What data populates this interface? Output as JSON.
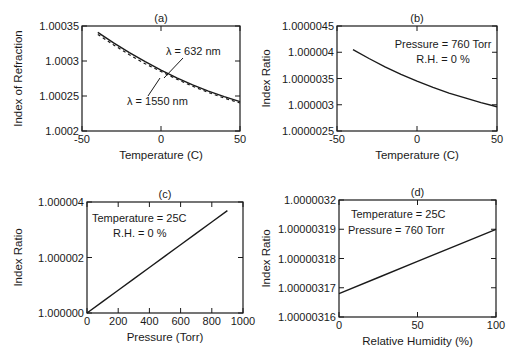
{
  "figure": {
    "panels": [
      {
        "id": "a",
        "label": "(a)",
        "frame": {
          "left": 82,
          "top": 26,
          "right": 240,
          "bottom": 131
        },
        "xlabel": "Temperature (C)",
        "ylabel": "Index of Refraction",
        "xlim": [
          -50,
          50
        ],
        "ylim": [
          1.0002,
          1.00035
        ],
        "xticks": [
          {
            "v": -50,
            "t": "-50"
          },
          {
            "v": 0,
            "t": "0"
          },
          {
            "v": 50,
            "t": "50"
          }
        ],
        "yticks": [
          {
            "v": 1.0002,
            "t": "1.0002"
          },
          {
            "v": 1.00025,
            "t": "1.00025"
          },
          {
            "v": 1.0003,
            "t": "1.0003"
          },
          {
            "v": 1.00035,
            "t": "1.00035"
          }
        ],
        "annotations": [
          {
            "text": "λ  = 632 nm",
            "x": 166,
            "y": 55
          },
          {
            "text": "λ  = 1550 nm",
            "x": 127,
            "y": 105
          }
        ],
        "leaders": [
          {
            "x1": 183,
            "y1": 58,
            "x2": 164,
            "y2": 78
          },
          {
            "x1": 160,
            "y1": 78,
            "x2": 148,
            "y2": 96
          }
        ]
      },
      {
        "id": "b",
        "label": "(b)",
        "frame": {
          "left": 337,
          "top": 26,
          "right": 497,
          "bottom": 131
        },
        "xlabel": "Temperature (C)",
        "ylabel": "Index Ratio",
        "xlim": [
          -50,
          50
        ],
        "ylim": [
          1.0000025,
          1.0000045
        ],
        "xticks": [
          {
            "v": -50,
            "t": "-50"
          },
          {
            "v": 0,
            "t": "0"
          },
          {
            "v": 50,
            "t": "50"
          }
        ],
        "yticks": [
          {
            "v": 1.0000025,
            "t": "1.0000025"
          },
          {
            "v": 1.000003,
            "t": "1.000003"
          },
          {
            "v": 1.0000035,
            "t": "1.0000035"
          },
          {
            "v": 1.000004,
            "t": "1.000004"
          },
          {
            "v": 1.0000045,
            "t": "1.0000045"
          }
        ],
        "annotations": [
          {
            "text": "Pressure = 760 Torr",
            "x": 443,
            "y": 48,
            "anchor": "middle"
          },
          {
            "text": "R.H. = 0 %",
            "x": 443,
            "y": 63,
            "anchor": "middle"
          }
        ],
        "leaders": []
      },
      {
        "id": "c",
        "label": "(c)",
        "frame": {
          "left": 87,
          "top": 202,
          "right": 243,
          "bottom": 313
        },
        "xlabel": "Pressure (Torr)",
        "ylabel": "Index Ratio",
        "xlim": [
          0,
          1000
        ],
        "ylim": [
          1.0,
          1.000004
        ],
        "xticks": [
          {
            "v": 0,
            "t": "0"
          },
          {
            "v": 200,
            "t": "200"
          },
          {
            "v": 400,
            "t": "400"
          },
          {
            "v": 600,
            "t": "600"
          },
          {
            "v": 800,
            "t": "800"
          },
          {
            "v": 1000,
            "t": "1000"
          }
        ],
        "yticks": [
          {
            "v": 1.0,
            "t": "1.000000"
          },
          {
            "v": 1.000002,
            "t": "1.000002"
          },
          {
            "v": 1.000004,
            "t": "1.000004"
          }
        ],
        "annotations": [
          {
            "text": "Temperature = 25C",
            "x": 92,
            "y": 222,
            "anchor": "start"
          },
          {
            "text": "R.H. = 0 %",
            "x": 113,
            "y": 237,
            "anchor": "start"
          }
        ],
        "leaders": []
      },
      {
        "id": "d",
        "label": "(d)",
        "frame": {
          "left": 339,
          "top": 200,
          "right": 496,
          "bottom": 317
        },
        "xlabel": "Relative Humidity (%)",
        "ylabel": "Index Ratio",
        "xlim": [
          0,
          100
        ],
        "ylim": [
          1.00000316,
          1.0000032
        ],
        "xticks": [
          {
            "v": 0,
            "t": "0"
          },
          {
            "v": 50,
            "t": "50"
          },
          {
            "v": 100,
            "t": "100"
          }
        ],
        "yticks": [
          {
            "v": 1.00000316,
            "t": "1.00000316"
          },
          {
            "v": 1.00000317,
            "t": "1.00000317"
          },
          {
            "v": 1.00000318,
            "t": "1.00000318"
          },
          {
            "v": 1.00000319,
            "t": "1.00000319"
          },
          {
            "v": 1.0000032,
            "t": "1.0000032"
          }
        ],
        "annotations": [
          {
            "text": "Temperature = 25C",
            "x": 351,
            "y": 218,
            "anchor": "start"
          },
          {
            "text": "Pressure = 760 Torr",
            "x": 348,
            "y": 234,
            "anchor": "start"
          }
        ],
        "leaders": []
      }
    ]
  },
  "chart_data": [
    {
      "type": "line",
      "title": "(a)",
      "xlabel": "Temperature (C)",
      "ylabel": "Index of Refraction",
      "xlim": [
        -50,
        50
      ],
      "ylim": [
        1.0002,
        1.00035
      ],
      "grid": false,
      "x": [
        -40,
        -30,
        -20,
        -10,
        0,
        10,
        20,
        30,
        40,
        50
      ],
      "series": [
        {
          "name": "λ = 632 nm",
          "style": "solid",
          "values": [
            1.000341,
            1.000326,
            1.000312,
            1.000299,
            1.000287,
            1.000276,
            1.000266,
            1.000257,
            1.000249,
            1.000242
          ]
        },
        {
          "name": "λ = 1550 nm",
          "style": "dashed",
          "values": [
            1.000338,
            1.000323,
            1.000309,
            1.000296,
            1.000285,
            1.000274,
            1.000264,
            1.000255,
            1.000247,
            1.00024
          ]
        }
      ],
      "annotations": [
        "λ = 632 nm",
        "λ = 1550 nm"
      ]
    },
    {
      "type": "line",
      "title": "(b)",
      "xlabel": "Temperature (C)",
      "ylabel": "Index Ratio",
      "xlim": [
        -50,
        50
      ],
      "ylim": [
        1.0000025,
        1.0000045
      ],
      "grid": false,
      "x": [
        -40,
        -30,
        -20,
        -10,
        0,
        10,
        20,
        30,
        40,
        50
      ],
      "series": [
        {
          "name": "Index Ratio",
          "style": "solid",
          "values": [
            1.00000405,
            1.00000388,
            1.00000372,
            1.00000358,
            1.00000345,
            1.00000333,
            1.00000322,
            1.00000313,
            1.00000304,
            1.00000296
          ]
        }
      ],
      "annotations": [
        "Pressure = 760 Torr",
        "R.H. = 0 %"
      ]
    },
    {
      "type": "line",
      "title": "(c)",
      "xlabel": "Pressure (Torr)",
      "ylabel": "Index Ratio",
      "xlim": [
        0,
        1000
      ],
      "ylim": [
        1.0,
        1.000004
      ],
      "grid": false,
      "x": [
        0,
        100,
        200,
        300,
        400,
        500,
        600,
        700,
        800,
        900
      ],
      "series": [
        {
          "name": "Index Ratio",
          "style": "solid",
          "values": [
            1.0,
            1.00000041,
            1.00000082,
            1.00000123,
            1.00000164,
            1.00000205,
            1.00000246,
            1.00000287,
            1.00000328,
            1.00000369
          ]
        }
      ],
      "annotations": [
        "Temperature = 25C",
        "R.H. = 0 %"
      ]
    },
    {
      "type": "line",
      "title": "(d)",
      "xlabel": "Relative Humidity (%)",
      "ylabel": "Index Ratio",
      "xlim": [
        0,
        100
      ],
      "ylim": [
        1.00000316,
        1.0000032
      ],
      "grid": false,
      "x": [
        0,
        25,
        50,
        75,
        100
      ],
      "series": [
        {
          "name": "Index Ratio",
          "style": "solid",
          "values": [
            1.000003168,
            1.0000031735,
            1.000003179,
            1.0000031845,
            1.00000319
          ]
        }
      ],
      "annotations": [
        "Temperature = 25C",
        "Pressure = 760 Torr"
      ]
    }
  ]
}
